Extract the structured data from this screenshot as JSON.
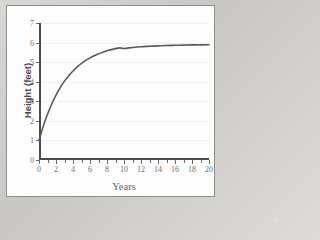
{
  "chart_data": {
    "type": "line",
    "title": "",
    "xlabel": "Years",
    "ylabel": "Height (feet)",
    "xlim": [
      0,
      20
    ],
    "ylim": [
      0,
      7
    ],
    "x_ticks": [
      0,
      1,
      2,
      3,
      4,
      5,
      6,
      7,
      8,
      9,
      10,
      11,
      12,
      13,
      14,
      15,
      16,
      17,
      18,
      19,
      20
    ],
    "x_tick_labels": [
      "0",
      "",
      "2",
      "",
      "4",
      "",
      "6",
      "",
      "8",
      "",
      "10",
      "",
      "12",
      "",
      "14",
      "",
      "16",
      "",
      "18",
      "",
      "20"
    ],
    "y_ticks": [
      0,
      1,
      2,
      3,
      4,
      5,
      6,
      7
    ],
    "y_tick_labels": [
      "0",
      "1",
      "2",
      "3",
      "4",
      "5",
      "6",
      "7"
    ],
    "grid": "horizontal",
    "legend": "none",
    "series": [
      {
        "name": "Height",
        "color": "#5a5a5a",
        "x": [
          0,
          0.5,
          1,
          1.5,
          2,
          2.5,
          3,
          3.5,
          4,
          4.5,
          5,
          5.5,
          6,
          6.5,
          7,
          7.5,
          8,
          8.5,
          9,
          9.5,
          10,
          11,
          12,
          13,
          14,
          15,
          16,
          17,
          18,
          19,
          20
        ],
        "values": [
          1.0,
          1.72,
          2.34,
          2.86,
          3.31,
          3.7,
          4.03,
          4.31,
          4.55,
          4.76,
          4.94,
          5.09,
          5.22,
          5.33,
          5.43,
          5.51,
          5.58,
          5.64,
          5.69,
          5.73,
          5.7,
          5.75,
          5.79,
          5.81,
          5.83,
          5.85,
          5.86,
          5.87,
          5.88,
          5.88,
          5.89
        ]
      }
    ],
    "annotations": {
      "start_point": "(0, 1)",
      "asymptote": "5.9"
    }
  },
  "axis_titles": {
    "x": "Years",
    "y": "Height (feet)"
  }
}
